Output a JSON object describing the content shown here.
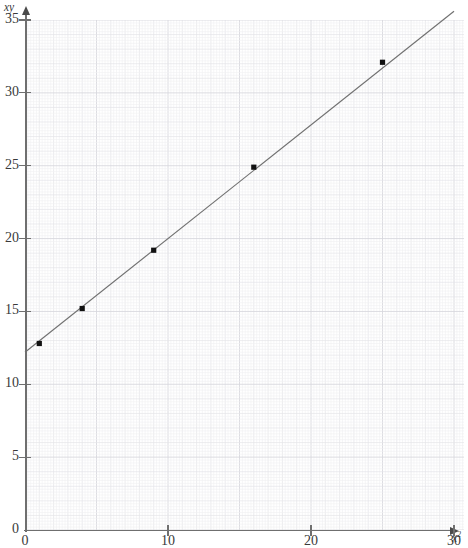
{
  "chart_data": {
    "type": "scatter",
    "title": "",
    "subtitle": "",
    "xlabel": "x²",
    "ylabel": "xy",
    "xlabel_base": "x",
    "xlabel_exp": "2",
    "ylabel_text": "xy",
    "xlim": [
      0,
      30.8
    ],
    "ylim": [
      0,
      35.6
    ],
    "x_ticks": [
      0,
      10,
      20,
      30
    ],
    "y_ticks": [
      0,
      5,
      10,
      15,
      20,
      25,
      30,
      35
    ],
    "x_tick_labels": [
      "0",
      "10",
      "20",
      "30"
    ],
    "y_tick_labels": [
      "0",
      "5",
      "10",
      "15",
      "20",
      "25",
      "30",
      "35"
    ],
    "grid": true,
    "grid_minor_step": 0.2,
    "grid_major_step": 1,
    "grid_bold_step": 5,
    "legend": "none",
    "points": [
      {
        "x": 1.0,
        "y": 12.8,
        "label": "(1, 12.8)"
      },
      {
        "x": 4.0,
        "y": 15.2,
        "label": "(4, 15.2)"
      },
      {
        "x": 9.0,
        "y": 19.2,
        "label": "(9, 19.2)"
      },
      {
        "x": 16.0,
        "y": 24.9,
        "label": "(16, 24.9)"
      },
      {
        "x": 25.0,
        "y": 32.1,
        "label": "(25, 32.1)"
      }
    ],
    "series": [
      {
        "name": "data points",
        "type": "scatter",
        "x": [
          1,
          4,
          9,
          16,
          25
        ],
        "values": [
          12.8,
          15.2,
          19.2,
          24.9,
          32.1
        ],
        "marker": "square",
        "color": "#111111"
      },
      {
        "name": "line of best fit",
        "type": "line",
        "x": [
          0,
          30.8
        ],
        "values": [
          12.2,
          36.2
        ],
        "slope": 0.78,
        "intercept": 12.2,
        "color": "#707070"
      }
    ],
    "fit_line": {
      "slope": 0.78,
      "intercept": 12.2,
      "x_start": 0,
      "y_start": 12.2,
      "x_end": 30.0,
      "y_end": 35.6
    },
    "colors": {
      "marker": "#111111",
      "fit_line": "#707070",
      "axis": "#6f6f6f",
      "grid_minor": "#f0f0f2",
      "grid_major": "#e4e4e8",
      "grid_bold": "#d8d8de",
      "tick_label": "#3a3a3a",
      "background": "#ffffff"
    }
  }
}
